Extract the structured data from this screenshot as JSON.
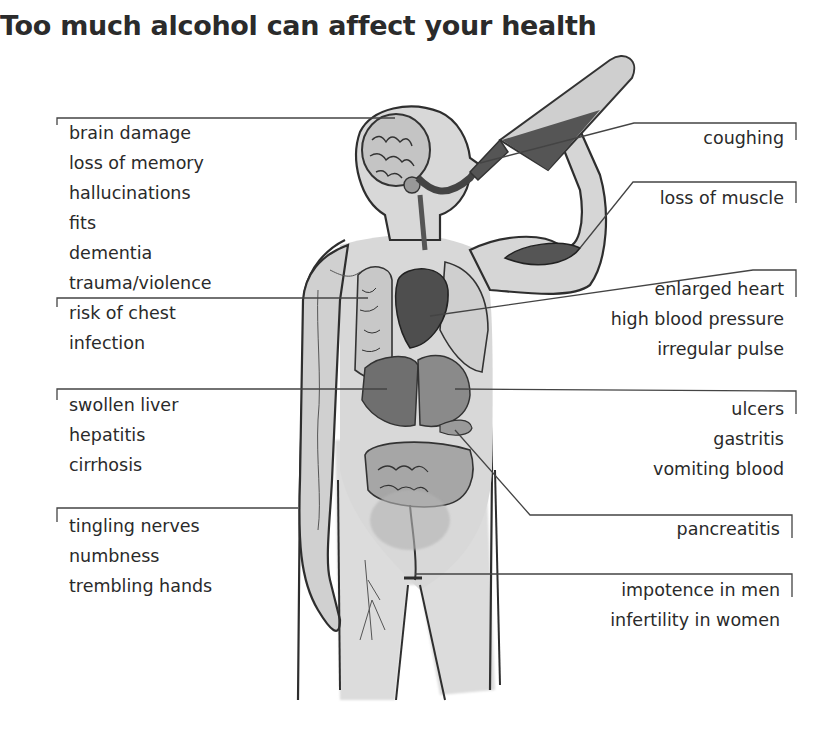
{
  "title": "Too much alcohol can affect your health",
  "left_labels": [
    {
      "organ": "brain",
      "items": [
        "brain damage",
        "loss of memory",
        "hallucinations",
        "fits",
        "dementia",
        "trauma/violence"
      ]
    },
    {
      "organ": "lungs",
      "items": [
        "risk of chest",
        "infection"
      ]
    },
    {
      "organ": "liver",
      "items": [
        "swollen liver",
        "hepatitis",
        "cirrhosis"
      ]
    },
    {
      "organ": "nerves",
      "items": [
        "tingling nerves",
        "numbness",
        "trembling hands"
      ]
    }
  ],
  "right_labels": [
    {
      "organ": "throat",
      "items": [
        "coughing"
      ]
    },
    {
      "organ": "muscle",
      "items": [
        "loss of muscle"
      ]
    },
    {
      "organ": "heart",
      "items": [
        "enlarged heart",
        "high blood pressure",
        "irregular pulse"
      ]
    },
    {
      "organ": "stomach",
      "items": [
        "ulcers",
        "gastritis",
        "vomiting blood"
      ]
    },
    {
      "organ": "pancreas",
      "items": [
        "pancreatitis"
      ]
    },
    {
      "organ": "reproductive",
      "items": [
        "impotence in men",
        "infertility in women"
      ]
    }
  ],
  "colors": {
    "line": "#444444",
    "body_fill": "#d0d0d0",
    "organ_dark": "#555555",
    "organ_mid": "#8a8a8a",
    "text": "#2a2a2a"
  }
}
